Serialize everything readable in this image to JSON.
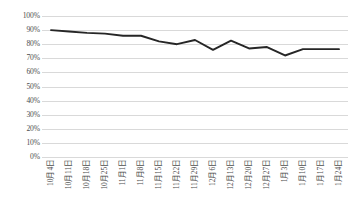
{
  "chart_data": {
    "type": "line",
    "title": "",
    "xlabel": "",
    "ylabel": "",
    "categories": [
      "10月4日",
      "10月11日",
      "10月18日",
      "10月25日",
      "11月1日",
      "11月8日",
      "11月15日",
      "11月22日",
      "11月29日",
      "12月6日",
      "12月13日",
      "12月20日",
      "12月27日",
      "1月3日",
      "1月10日",
      "1月17日",
      "1月24日"
    ],
    "values": [
      90,
      89,
      88,
      87.5,
      86,
      86,
      82,
      80,
      83,
      76,
      82.5,
      77,
      78,
      72,
      76.5,
      76.5,
      76.5
    ],
    "ylim": [
      0,
      100
    ],
    "y_ticks": [
      "100%",
      "90%",
      "80%",
      "70%",
      "60%",
      "50%",
      "40%",
      "30%",
      "20%",
      "10%",
      "0%"
    ],
    "y_tick_values": [
      100,
      90,
      80,
      70,
      60,
      50,
      40,
      30,
      20,
      10,
      0
    ],
    "grid": true,
    "legend": "none",
    "series": [
      {
        "name": "",
        "color": "#262626",
        "values": [
          90,
          89,
          88,
          87.5,
          86,
          86,
          82,
          80,
          83,
          76,
          82.5,
          77,
          78,
          72,
          76.5,
          76.5,
          76.5
        ]
      }
    ],
    "colors": {
      "line": "#262626",
      "grid": "#d9d9d9",
      "text": "#4d4d4d",
      "background": "#ffffff"
    }
  }
}
